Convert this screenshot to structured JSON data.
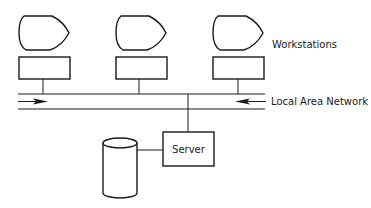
{
  "diagram": {
    "title": "",
    "colors": {
      "line": "#1a1a1a",
      "background": "#ffffff"
    },
    "workstations": {
      "label": "Workstations",
      "items": [
        {
          "id": "ws1",
          "icon": "monitor-icon"
        },
        {
          "id": "ws2",
          "icon": "monitor-icon"
        },
        {
          "id": "ws3",
          "icon": "monitor-icon"
        }
      ]
    },
    "network": {
      "label": "Local Area Network",
      "arrows": [
        "right",
        "left"
      ]
    },
    "server": {
      "label": "Server"
    },
    "storage": {
      "icon": "database-cylinder-icon"
    }
  }
}
